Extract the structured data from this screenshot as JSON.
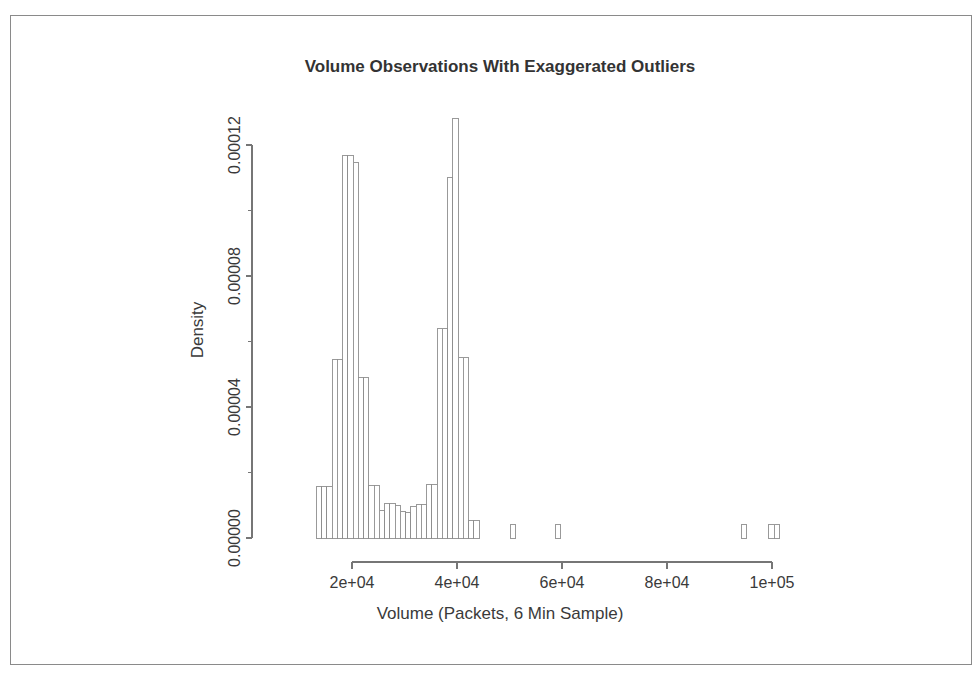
{
  "figure": {
    "border_color": "#8a8a8a",
    "background": "#ffffff"
  },
  "chart_data": {
    "type": "bar",
    "subtype": "histogram",
    "title": "Volume Observations With Exaggerated Outliers",
    "xlabel": "Volume (Packets, 6 Min Sample)",
    "ylabel": "Density",
    "grid": false,
    "legend": null,
    "xlim": [
      13200,
      101500
    ],
    "ylim": [
      0,
      0.000128
    ],
    "xticks": [
      20000,
      40000,
      60000,
      80000,
      100000
    ],
    "xtick_labels": [
      "2e+04",
      "4e+04",
      "6e+04",
      "8e+04",
      "1e+05"
    ],
    "yticks": [
      0.0,
      4e-05,
      8e-05,
      0.00012
    ],
    "ytick_labels": [
      "0.00000",
      "0.00004",
      "0.00008",
      "0.00012"
    ],
    "y_minor_ticks": [
      2e-05,
      6e-05,
      0.0001
    ],
    "bin_width": 1000,
    "bins": [
      {
        "x0": 13200,
        "x1": 14200,
        "density": 1.58e-05
      },
      {
        "x0": 14200,
        "x1": 15200,
        "density": 1.58e-05
      },
      {
        "x0": 15200,
        "x1": 16200,
        "density": 1.58e-05
      },
      {
        "x0": 16200,
        "x1": 17200,
        "density": 5.44e-05
      },
      {
        "x0": 17200,
        "x1": 18200,
        "density": 5.44e-05
      },
      {
        "x0": 18200,
        "x1": 19200,
        "density": 0.0001168
      },
      {
        "x0": 19200,
        "x1": 20200,
        "density": 0.0001168
      },
      {
        "x0": 20200,
        "x1": 21200,
        "density": 0.0001148
      },
      {
        "x0": 21200,
        "x1": 22200,
        "density": 4.9e-05
      },
      {
        "x0": 22200,
        "x1": 23200,
        "density": 4.9e-05
      },
      {
        "x0": 23200,
        "x1": 24200,
        "density": 1.6e-05
      },
      {
        "x0": 24200,
        "x1": 25200,
        "density": 1.6e-05
      },
      {
        "x0": 25200,
        "x1": 26200,
        "density": 8.5e-06
      },
      {
        "x0": 26200,
        "x1": 27200,
        "density": 1.05e-05
      },
      {
        "x0": 27200,
        "x1": 28200,
        "density": 1.05e-05
      },
      {
        "x0": 28200,
        "x1": 29200,
        "density": 9.8e-06
      },
      {
        "x0": 29200,
        "x1": 30200,
        "density": 8.2e-06
      },
      {
        "x0": 30200,
        "x1": 31200,
        "density": 7.8e-06
      },
      {
        "x0": 31200,
        "x1": 32200,
        "density": 9.5e-06
      },
      {
        "x0": 32200,
        "x1": 33200,
        "density": 1.02e-05
      },
      {
        "x0": 33200,
        "x1": 34200,
        "density": 1.02e-05
      },
      {
        "x0": 34200,
        "x1": 35200,
        "density": 1.62e-05
      },
      {
        "x0": 35200,
        "x1": 36200,
        "density": 1.62e-05
      },
      {
        "x0": 36200,
        "x1": 37200,
        "density": 6.4e-05
      },
      {
        "x0": 37200,
        "x1": 38200,
        "density": 6.4e-05
      },
      {
        "x0": 38200,
        "x1": 39200,
        "density": 0.00011
      },
      {
        "x0": 39200,
        "x1": 40200,
        "density": 0.000128
      },
      {
        "x0": 40200,
        "x1": 41200,
        "density": 5.52e-05
      },
      {
        "x0": 41200,
        "x1": 42200,
        "density": 5.52e-05
      },
      {
        "x0": 42200,
        "x1": 43200,
        "density": 5.2e-06
      },
      {
        "x0": 43200,
        "x1": 44200,
        "density": 5.2e-06
      },
      {
        "x0": 50200,
        "x1": 51200,
        "density": 4.2e-06
      },
      {
        "x0": 58700,
        "x1": 59700,
        "density": 4.2e-06
      },
      {
        "x0": 94200,
        "x1": 95200,
        "density": 4.2e-06
      },
      {
        "x0": 99400,
        "x1": 100400,
        "density": 4.2e-06
      },
      {
        "x0": 100400,
        "x1": 101400,
        "density": 4.2e-06
      }
    ]
  },
  "plot_geometry": {
    "left": 266,
    "right": 790,
    "top": 110,
    "bottom": 538,
    "x_axis_start_value": 20000,
    "x_axis_end_value": 100000,
    "x_axis_start_px": 352,
    "x_axis_end_px": 772,
    "y_axis_top_value": 0.00012,
    "y_axis_top_px": 145,
    "y_axis_zero_px": 538
  }
}
